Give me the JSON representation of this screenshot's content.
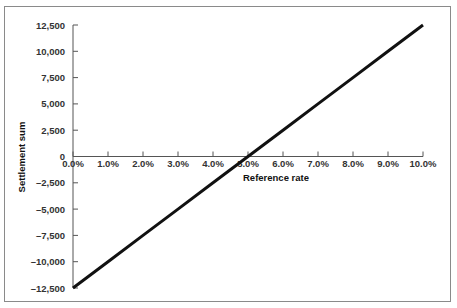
{
  "chart_data": {
    "type": "line",
    "title": "",
    "xlabel": "Reference rate",
    "ylabel": "Settlement sum",
    "x_tick_labels": [
      "0.0%",
      "1.0%",
      "2.0%",
      "3.0%",
      "4.0%",
      "5.0%",
      "6.0%",
      "7.0%",
      "8.0%",
      "9.0%",
      "10.0%"
    ],
    "y_tick_labels": [
      "12,500",
      "10,000",
      "7,500",
      "5,000",
      "2,500",
      "0",
      "-2,500",
      "-5,000",
      "-7,500",
      "-10,000",
      "-12,500"
    ],
    "xlim": [
      0,
      10
    ],
    "ylim": [
      -12500,
      12500
    ],
    "grid": false,
    "legend": null,
    "series": [
      {
        "name": "Settlement sum",
        "color": "#111111",
        "x": [
          0,
          1,
          2,
          3,
          4,
          5,
          6,
          7,
          8,
          9,
          10
        ],
        "values": [
          -12500,
          -10000,
          -7500,
          -5000,
          -2500,
          0,
          2500,
          5000,
          7500,
          10000,
          12500
        ]
      }
    ]
  }
}
